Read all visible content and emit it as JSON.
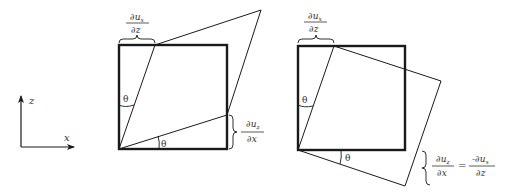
{
  "axes": {
    "z_label": "z",
    "x_label": "x"
  },
  "left_diagram": {
    "angle_top": "θ",
    "angle_bottom": "θ",
    "top_fraction": {
      "numerator": "∂u",
      "num_sub": "x",
      "denominator": "∂z"
    },
    "right_fraction": {
      "numerator": "∂u",
      "num_sub": "z",
      "denominator": "∂x"
    }
  },
  "right_diagram": {
    "angle_top": "θ",
    "angle_bottom": "θ",
    "top_fraction": {
      "numerator": "∂u",
      "num_sub": "x",
      "denominator": "∂z"
    },
    "equation": {
      "lhs": {
        "numerator": "∂u",
        "num_sub": "z",
        "denominator": "∂x"
      },
      "equals": "=",
      "rhs": {
        "numerator": "-∂u",
        "num_sub": "x",
        "denominator": "∂z"
      }
    }
  },
  "colors": {
    "stroke": "#1a1a1a",
    "text": "#333333",
    "background": "#ffffff"
  }
}
